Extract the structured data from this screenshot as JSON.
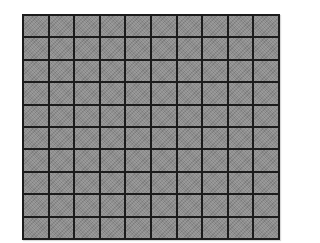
{
  "grid": {
    "rows": 10,
    "columns": 10,
    "cell_color": "#8c8c8c",
    "line_color": "#1c1c1c",
    "background_color": "#ffffff"
  }
}
